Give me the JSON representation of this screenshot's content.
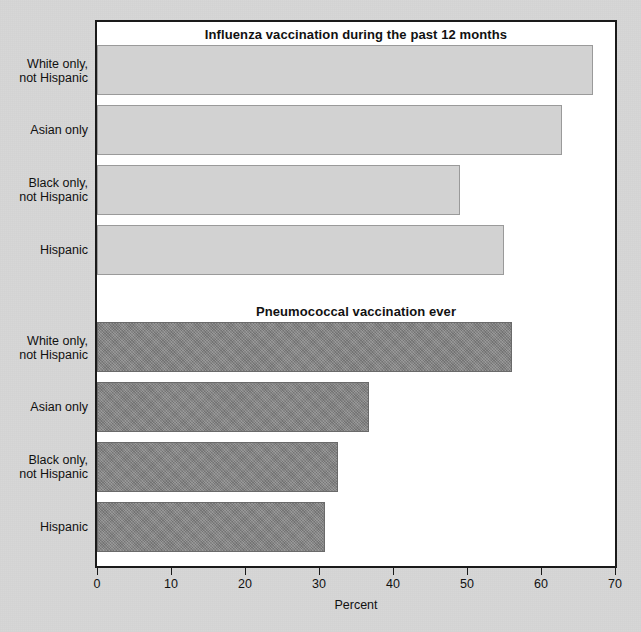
{
  "chart_data": {
    "type": "bar",
    "orientation": "horizontal",
    "title": "",
    "xlabel": "Percent",
    "ylabel": "",
    "xlim": [
      0,
      70
    ],
    "xticks": [
      0,
      10,
      20,
      30,
      40,
      50,
      60,
      70
    ],
    "grid": false,
    "legend": "none",
    "categories": [
      "White only, not Hispanic",
      "Asian only",
      "Black only, not Hispanic",
      "Hispanic"
    ],
    "panels": [
      {
        "title": "Influenza vaccination during the past 12 months",
        "series_name": "Influenza vaccination during the past 12 months",
        "color": "#d2d2d2",
        "values": [
          67.0,
          62.8,
          49.0,
          55.0
        ],
        "bars": [
          {
            "label_line1": "White only,",
            "label_line2": "not Hispanic",
            "value": 67.0
          },
          {
            "label_line1": "Asian only",
            "label_line2": "",
            "value": 62.8
          },
          {
            "label_line1": "Black only,",
            "label_line2": "not Hispanic",
            "value": 49.0
          },
          {
            "label_line1": "Hispanic",
            "label_line2": "",
            "value": 55.0
          }
        ]
      },
      {
        "title": "Pneumococcal vaccination ever",
        "series_name": "Pneumococcal vaccination ever",
        "color": "#838383",
        "values": [
          56.1,
          36.7,
          32.6,
          30.8
        ],
        "bars": [
          {
            "label_line1": "White only,",
            "label_line2": "not Hispanic",
            "value": 56.1
          },
          {
            "label_line1": "Asian only",
            "label_line2": "",
            "value": 36.7
          },
          {
            "label_line1": "Black only,",
            "label_line2": "not Hispanic",
            "value": 32.6
          },
          {
            "label_line1": "Hispanic",
            "label_line2": "",
            "value": 30.8
          }
        ]
      }
    ],
    "axis": {
      "tick_labels": [
        "0",
        "10",
        "20",
        "30",
        "40",
        "50",
        "60",
        "70"
      ],
      "title": "Percent"
    }
  }
}
